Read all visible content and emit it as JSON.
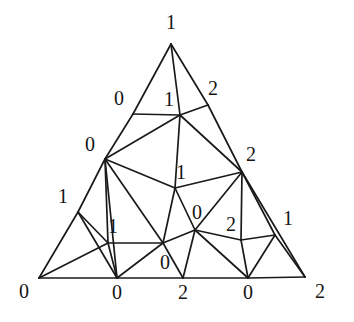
{
  "figure": {
    "name": "sperner-triangulation",
    "type": "triangulation-diagram",
    "background_color": "#ffffff",
    "line_color": "#1a1a1a",
    "label_color": "#141414"
  },
  "vertices": [
    {
      "id": "v-bottom-left-corner",
      "x": 39,
      "y": 278,
      "label": "0",
      "label_x": 24,
      "label_y": 291
    },
    {
      "id": "v-apex",
      "x": 171,
      "y": 44,
      "label": "1",
      "label_x": 171,
      "label_y": 22
    },
    {
      "id": "v-bottom-right-corner",
      "x": 305,
      "y": 277,
      "label": "2",
      "label_x": 320,
      "label_y": 291
    },
    {
      "id": "v-left-upper",
      "x": 133,
      "y": 114,
      "label": "0",
      "label_x": 119,
      "label_y": 98
    },
    {
      "id": "v-left-mid",
      "x": 105,
      "y": 159,
      "label": "0",
      "label_x": 90,
      "label_y": 144
    },
    {
      "id": "v-left-lower",
      "x": 78,
      "y": 212,
      "label": "1",
      "label_x": 63,
      "label_y": 196
    },
    {
      "id": "v-right-upper",
      "x": 208,
      "y": 105,
      "label": "2",
      "label_x": 213,
      "label_y": 88
    },
    {
      "id": "v-right-mid",
      "x": 242,
      "y": 172,
      "label": "2",
      "label_x": 251,
      "label_y": 154
    },
    {
      "id": "v-right-lower",
      "x": 275,
      "y": 235,
      "label": "1",
      "label_x": 288,
      "label_y": 218
    },
    {
      "id": "v-bottom-1",
      "x": 117,
      "y": 278,
      "label": "0",
      "label_x": 117,
      "label_y": 292
    },
    {
      "id": "v-bottom-2",
      "x": 183,
      "y": 278,
      "label": "2",
      "label_x": 183,
      "label_y": 292
    },
    {
      "id": "v-bottom-3",
      "x": 248,
      "y": 278,
      "label": "0",
      "label_x": 248,
      "label_y": 292
    },
    {
      "id": "v-inner-top",
      "x": 180,
      "y": 115,
      "label": "1",
      "label_x": 169,
      "label_y": 99
    },
    {
      "id": "v-inner-center",
      "x": 175,
      "y": 188,
      "label": "1",
      "label_x": 181,
      "label_y": 172
    },
    {
      "id": "v-inner-left",
      "x": 108,
      "y": 243,
      "label": "1",
      "label_x": 113,
      "label_y": 226
    },
    {
      "id": "v-inner-bottom",
      "x": 163,
      "y": 243,
      "label": "0",
      "label_x": 165,
      "label_y": 262
    },
    {
      "id": "v-inner-right",
      "x": 195,
      "y": 230,
      "label": "0",
      "label_x": 197,
      "label_y": 212
    },
    {
      "id": "v-inner-right-low",
      "x": 241,
      "y": 240,
      "label": "2",
      "label_x": 231,
      "label_y": 224
    }
  ],
  "edges": [
    [
      "v-apex",
      "v-left-upper"
    ],
    [
      "v-left-upper",
      "v-left-mid"
    ],
    [
      "v-left-mid",
      "v-left-lower"
    ],
    [
      "v-left-lower",
      "v-bottom-left-corner"
    ],
    [
      "v-apex",
      "v-right-upper"
    ],
    [
      "v-right-upper",
      "v-right-mid"
    ],
    [
      "v-right-mid",
      "v-right-lower"
    ],
    [
      "v-right-lower",
      "v-bottom-right-corner"
    ],
    [
      "v-bottom-left-corner",
      "v-bottom-1"
    ],
    [
      "v-bottom-1",
      "v-bottom-2"
    ],
    [
      "v-bottom-2",
      "v-bottom-3"
    ],
    [
      "v-bottom-3",
      "v-bottom-right-corner"
    ],
    [
      "v-apex",
      "v-inner-top"
    ],
    [
      "v-left-upper",
      "v-inner-top"
    ],
    [
      "v-right-upper",
      "v-inner-top"
    ],
    [
      "v-left-mid",
      "v-inner-top"
    ],
    [
      "v-inner-top",
      "v-right-mid"
    ],
    [
      "v-inner-top",
      "v-inner-center"
    ],
    [
      "v-left-mid",
      "v-inner-center"
    ],
    [
      "v-inner-center",
      "v-right-mid"
    ],
    [
      "v-left-mid",
      "v-inner-left"
    ],
    [
      "v-left-mid",
      "v-inner-bottom"
    ],
    [
      "v-left-mid",
      "v-bottom-1"
    ],
    [
      "v-left-lower",
      "v-inner-left"
    ],
    [
      "v-left-lower",
      "v-bottom-1"
    ],
    [
      "v-bottom-left-corner",
      "v-inner-left"
    ],
    [
      "v-inner-left",
      "v-inner-bottom"
    ],
    [
      "v-inner-left",
      "v-bottom-1"
    ],
    [
      "v-bottom-1",
      "v-inner-bottom"
    ],
    [
      "v-inner-center",
      "v-inner-bottom"
    ],
    [
      "v-inner-center",
      "v-inner-right"
    ],
    [
      "v-inner-bottom",
      "v-inner-right"
    ],
    [
      "v-inner-bottom",
      "v-bottom-2"
    ],
    [
      "v-inner-right",
      "v-bottom-2"
    ],
    [
      "v-inner-right",
      "v-right-mid"
    ],
    [
      "v-inner-right",
      "v-inner-right-low"
    ],
    [
      "v-inner-right",
      "v-bottom-3"
    ],
    [
      "v-right-mid",
      "v-inner-right-low"
    ],
    [
      "v-right-mid",
      "v-bottom-right-corner"
    ],
    [
      "v-inner-right-low",
      "v-right-lower"
    ],
    [
      "v-inner-right-low",
      "v-bottom-3"
    ],
    [
      "v-bottom-3",
      "v-right-lower"
    ]
  ]
}
